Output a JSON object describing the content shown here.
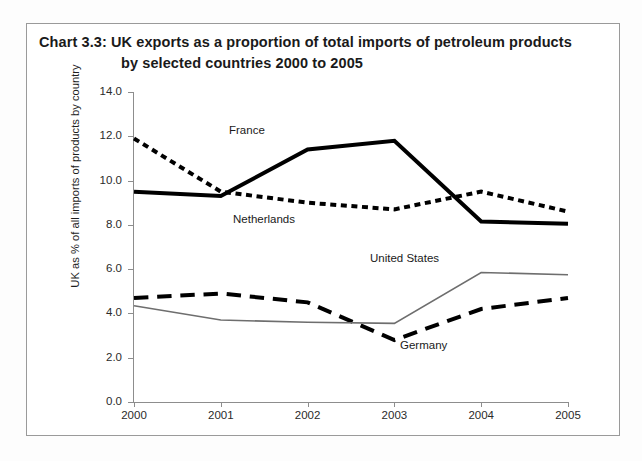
{
  "chart": {
    "title_prefix": "Chart 3.3:",
    "title_line1": "Chart 3.3:   UK exports as a proportion of total imports of petroleum products",
    "title_line2": "by selected countries 2000 to 2005",
    "y_axis_title": "UK as % of all imports of products by country",
    "y_ticks": [
      "0.0",
      "2.0",
      "4.0",
      "6.0",
      "8.0",
      "10.0",
      "12.0",
      "14.0"
    ],
    "x_ticks": [
      "2000",
      "2001",
      "2002",
      "2003",
      "2004",
      "2005"
    ],
    "labels": {
      "france": "France",
      "netherlands": "Netherlands",
      "united_states": "United States",
      "germany": "Germany"
    },
    "colors": {
      "france": "#000000",
      "netherlands": "#000000",
      "germany": "#000000",
      "united_states": "#6e6e6e",
      "axis": "#8d8d8d",
      "frame": "#9a9a9a",
      "text": "#1a1a1a"
    }
  },
  "chart_data": {
    "type": "line",
    "title": "Chart 3.3: UK exports as a proportion of total imports of petroleum products by selected countries 2000 to 2005",
    "xlabel": "",
    "ylabel": "UK as % of all imports of products by country",
    "x": [
      "2000",
      "2001",
      "2002",
      "2003",
      "2004",
      "2005"
    ],
    "categories": [
      "2000",
      "2001",
      "2002",
      "2003",
      "2004",
      "2005"
    ],
    "ylim": [
      0.0,
      14.0
    ],
    "ytick_step": 2.0,
    "grid": false,
    "legend": "inline-annotations",
    "series": [
      {
        "name": "France",
        "values": [
          9.5,
          9.3,
          11.4,
          11.8,
          8.15,
          8.05
        ],
        "style": "solid",
        "width": 4,
        "color": "#000000"
      },
      {
        "name": "Netherlands",
        "values": [
          11.9,
          9.5,
          9.0,
          8.7,
          9.5,
          8.6
        ],
        "style": "dotted",
        "width": 4,
        "color": "#000000"
      },
      {
        "name": "Germany",
        "values": [
          4.7,
          4.9,
          4.5,
          2.8,
          4.2,
          4.7
        ],
        "style": "dashed",
        "width": 4,
        "color": "#000000"
      },
      {
        "name": "United States",
        "values": [
          4.35,
          3.7,
          3.6,
          3.55,
          5.85,
          5.75
        ],
        "style": "solid",
        "width": 1.6,
        "color": "#6e6e6e"
      }
    ]
  }
}
